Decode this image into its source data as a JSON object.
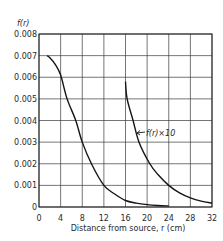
{
  "chart_data": {
    "type": "line",
    "title": "",
    "xlabel": "Distance from source, r (cm)",
    "ylabel": "f(r)",
    "xlim": [
      0,
      32
    ],
    "ylim": [
      0,
      0.008
    ],
    "x_ticks": [
      0,
      4,
      8,
      12,
      16,
      20,
      24,
      28,
      32
    ],
    "x_tick_labels": [
      "0",
      "4",
      "8",
      "12",
      "16",
      "20",
      "24",
      "28",
      "32"
    ],
    "y_ticks": [
      0,
      0.001,
      0.002,
      0.003,
      0.004,
      0.005,
      0.006,
      0.007,
      0.008
    ],
    "y_tick_labels": [
      "0",
      "0.001",
      "0.002",
      "0.003",
      "0.004",
      "0.005",
      "0.006",
      "0.007",
      "0.008"
    ],
    "grid": true,
    "legend": "none (inline annotation)",
    "series": [
      {
        "name": "f(r)",
        "x": [
          1.5,
          2,
          3,
          4,
          5.2,
          6.8,
          8,
          9.7,
          12,
          14,
          16,
          18,
          20,
          22,
          24
        ],
        "y": [
          0.007,
          0.0069,
          0.0066,
          0.0061,
          0.005,
          0.004,
          0.003,
          0.002,
          0.001,
          0.0006,
          0.0003,
          0.00018,
          0.00011,
          7e-05,
          5e-05
        ]
      },
      {
        "name": "f(r)×10",
        "x": [
          16,
          16.3,
          17.4,
          18.5,
          20.5,
          22,
          24,
          26,
          28,
          30,
          32
        ],
        "y": [
          0.0058,
          0.005,
          0.004,
          0.003,
          0.002,
          0.0015,
          0.001,
          0.00065,
          0.00042,
          0.00027,
          0.00018
        ]
      }
    ],
    "annotations": [
      {
        "text": "f(r)×10",
        "points_to_series": "f(r)×10",
        "x": 19.5,
        "y": 0.0035
      }
    ]
  }
}
